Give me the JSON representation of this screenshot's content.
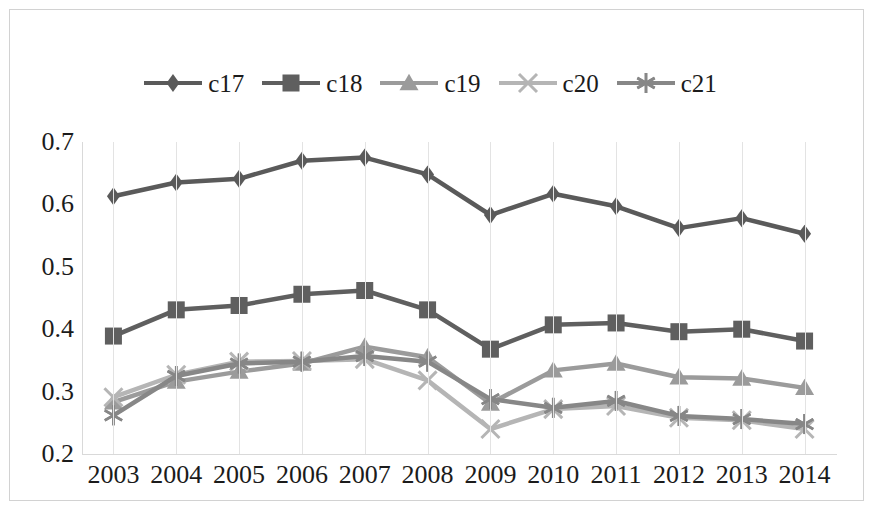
{
  "chart_data": {
    "type": "line",
    "title": "",
    "subtitle": "",
    "xlabel": "",
    "ylabel": "",
    "grid": "vertical",
    "legend_position": "top",
    "ylim": [
      0.2,
      0.7
    ],
    "yticks": [
      "0.7",
      "0.6",
      "0.5",
      "0.4",
      "0.3",
      "0.2"
    ],
    "ytick_values": [
      0.7,
      0.6,
      0.5,
      0.4,
      0.3,
      0.2
    ],
    "categories": [
      "2003",
      "2004",
      "2005",
      "2006",
      "2007",
      "2008",
      "2009",
      "2010",
      "2011",
      "2012",
      "2013",
      "2014"
    ],
    "x": [
      2003,
      2004,
      2005,
      2006,
      2007,
      2008,
      2009,
      2010,
      2011,
      2012,
      2013,
      2014
    ],
    "series": [
      {
        "name": "c17",
        "marker": "diamond",
        "color": "#5a5a5a",
        "values": [
          0.613,
          0.635,
          0.641,
          0.67,
          0.675,
          0.648,
          0.583,
          0.617,
          0.597,
          0.562,
          0.578,
          0.553
        ]
      },
      {
        "name": "c18",
        "marker": "square",
        "color": "#5f5f5f",
        "values": [
          0.389,
          0.431,
          0.438,
          0.456,
          0.462,
          0.431,
          0.368,
          0.407,
          0.41,
          0.396,
          0.4,
          0.381
        ]
      },
      {
        "name": "c19",
        "marker": "triangle",
        "color": "#9b9b9b",
        "values": [
          0.283,
          0.316,
          0.332,
          0.345,
          0.372,
          0.355,
          0.281,
          0.334,
          0.345,
          0.323,
          0.321,
          0.306
        ]
      },
      {
        "name": "c20",
        "marker": "x",
        "color": "#b5b5b5",
        "values": [
          0.291,
          0.327,
          0.348,
          0.349,
          0.352,
          0.318,
          0.24,
          0.272,
          0.277,
          0.258,
          0.254,
          0.24
        ]
      },
      {
        "name": "c21",
        "marker": "asterisk",
        "color": "#878787",
        "values": [
          0.262,
          0.325,
          0.345,
          0.348,
          0.357,
          0.348,
          0.288,
          0.274,
          0.285,
          0.261,
          0.256,
          0.248
        ]
      }
    ]
  },
  "legend": {
    "items": [
      {
        "label": "c17"
      },
      {
        "label": "c18"
      },
      {
        "label": "c19"
      },
      {
        "label": "c20"
      },
      {
        "label": "c21"
      }
    ]
  },
  "colors": {
    "frame_border": "#d2d2d2",
    "gridline": "#e3e3e3",
    "axis_line": "#d9d9d9",
    "text": "#1b1b1b",
    "background": "#ffffff"
  }
}
